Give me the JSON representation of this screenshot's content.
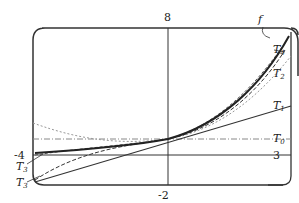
{
  "diagram": {
    "axis_labels": {
      "y_top": "8",
      "x_bottom": "-2",
      "left": "-4",
      "right": "3"
    },
    "curves": [
      {
        "name": "f",
        "label": "f",
        "style": "thick solid"
      },
      {
        "name": "T0",
        "label": "T",
        "sub": "0",
        "style": "dash-dot"
      },
      {
        "name": "T1",
        "label": "T",
        "sub": "1",
        "style": "solid"
      },
      {
        "name": "T2",
        "label": "T",
        "sub": "2",
        "style": "dotted dashed"
      },
      {
        "name": "T3",
        "label": "T",
        "sub": "3",
        "style": "dashed"
      },
      {
        "name": "T4",
        "label": "T",
        "sub": "4",
        "style": "dashed"
      },
      {
        "name": "T3_left",
        "label": "T",
        "sub": "3",
        "style": "dashed"
      }
    ],
    "colors": {
      "line": "#333333",
      "light": "#888888",
      "background": "#ffffff"
    }
  }
}
